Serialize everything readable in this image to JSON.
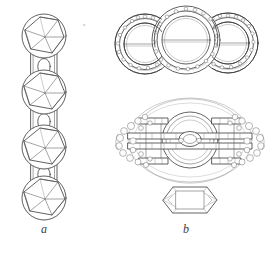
{
  "plate": {
    "kind": "archaeological-line-drawing-plate",
    "background_color": "#ffffff",
    "ink_color": "#3a3a3c",
    "width": 275,
    "height": 254,
    "captions": [
      {
        "id": "a",
        "label": "a",
        "subject": "beaded chain with faceted spherical beads and rectangular connector links"
      },
      {
        "id": "b",
        "label": "b",
        "subject": "triple-ring ornament, oval granulated brooch and hexagonal plaque"
      }
    ]
  },
  "figure_a": {
    "name": "beaded-chain",
    "bead_count": 4,
    "link_count": 3,
    "bead_description": "sphere with inscribed hexagon and three-spoke radiating facets",
    "link_description": "rectangular plate pierced by an oval aperture",
    "beads": [
      {
        "index": 1,
        "cx": 44,
        "cy": 37,
        "r": 22
      },
      {
        "index": 2,
        "cx": 44,
        "cy": 93,
        "r": 22
      },
      {
        "index": 3,
        "cx": 44,
        "cy": 148,
        "r": 22
      },
      {
        "index": 4,
        "cx": 44,
        "cy": 199,
        "r": 22
      }
    ],
    "links": [
      {
        "index": 1,
        "cx": 44,
        "cy": 66
      },
      {
        "index": 2,
        "cx": 44,
        "cy": 121
      },
      {
        "index": 3,
        "cx": 44,
        "cy": 174
      }
    ]
  },
  "figure_b": {
    "name": "ring-and-brooch-group",
    "parts": [
      {
        "id": "triple-rings",
        "label": "three interlocking granulated rings",
        "ring_count": 3,
        "rings": [
          {
            "index": 1,
            "cx": 145,
            "cy": 43,
            "rx": 30,
            "ry": 29,
            "size": "side"
          },
          {
            "index": 2,
            "cx": 186,
            "cy": 40,
            "rx": 34,
            "ry": 33,
            "size": "centre"
          },
          {
            "index": 3,
            "cx": 228,
            "cy": 43,
            "rx": 30,
            "ry": 29,
            "size": "side"
          }
        ],
        "has_transverse_bar": true,
        "decoration": "beaded filigree band on outer hoop"
      },
      {
        "id": "oval-brooch",
        "label": "oval brooch with central ring and granulated terminals",
        "cx": 190,
        "cy": 140,
        "rx": 68,
        "ry": 44,
        "central_ring_r": 26,
        "bar_count": 3,
        "decoration": "clustered granules at both terminals, ladder bars across face"
      },
      {
        "id": "hexagonal-plaque",
        "label": "hexagonal plaque with rectangular inner frame",
        "cx": 190,
        "cy": 200,
        "width": 54,
        "height": 30
      }
    ]
  }
}
